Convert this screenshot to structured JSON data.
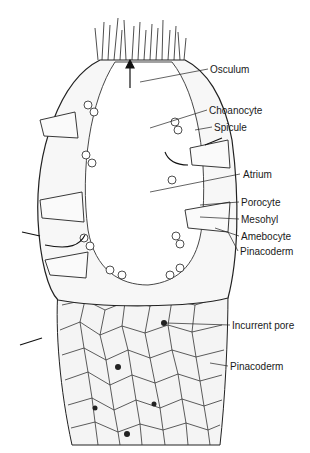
{
  "figure": {
    "labels": [
      {
        "id": "osculum",
        "text": "Osculum",
        "x": 210,
        "y": 64
      },
      {
        "id": "choanocyte",
        "text": "Choanocyte",
        "x": 209,
        "y": 105
      },
      {
        "id": "spicule",
        "text": "Spicule",
        "x": 214,
        "y": 122
      },
      {
        "id": "atrium",
        "text": "Atrium",
        "x": 243,
        "y": 169
      },
      {
        "id": "porocyte",
        "text": "Porocyte",
        "x": 241,
        "y": 197
      },
      {
        "id": "mesohyl",
        "text": "Mesohyl",
        "x": 241,
        "y": 214
      },
      {
        "id": "amebocyte",
        "text": "Amebocyte",
        "x": 241,
        "y": 231
      },
      {
        "id": "pinacoderm-upper",
        "text": "Pinacoderm",
        "x": 240,
        "y": 246
      },
      {
        "id": "incurrent-pore",
        "text": "Incurrent pore",
        "x": 232,
        "y": 320
      },
      {
        "id": "pinacoderm-lower",
        "text": "Pinacoderm",
        "x": 230,
        "y": 361
      }
    ],
    "colors": {
      "ink": "#1a1a1a",
      "cell_fill": "#f2f2f2",
      "background": "#ffffff"
    }
  }
}
